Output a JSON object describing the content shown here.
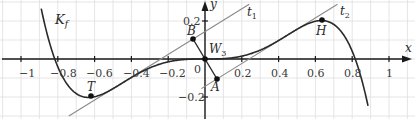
{
  "graph": {
    "axes": {
      "x_label": "x",
      "y_label": "y",
      "origin_label": "0"
    },
    "x_ticks": [
      "−1",
      "−0.8",
      "−0.6",
      "−0.4",
      "−0.2",
      "0.2",
      "0.4",
      "0.6",
      "0.8",
      "1"
    ],
    "y_ticks": [
      "0.2",
      "−0.2"
    ],
    "curve_label": "K",
    "curve_label_sub": "f",
    "tangent_1": {
      "name": "t",
      "sub": "1"
    },
    "tangent_2": {
      "name": "t",
      "sub": "2"
    },
    "points": {
      "T": {
        "label": "T",
        "x": -0.62,
        "y": -0.19
      },
      "H": {
        "label": "H",
        "x": 0.63,
        "y": 0.2
      },
      "A": {
        "label": "A",
        "x": 0.065,
        "y": -0.105
      },
      "B": {
        "label": "B",
        "x": -0.065,
        "y": 0.105
      },
      "W3": {
        "label": "W",
        "sub": "3",
        "x": 0,
        "y": 0
      }
    },
    "colors": {
      "axis": "#1a1a1a",
      "grid": "#d9d9d9",
      "curve": "#2a2a2a",
      "tangent": "#8a8a8a"
    }
  }
}
